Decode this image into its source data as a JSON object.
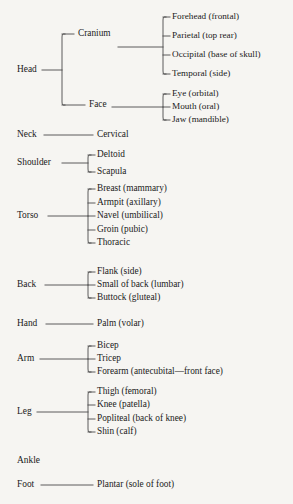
{
  "diagram": {
    "title": "Anatomical Regions Tree",
    "type": "hierarchy-tree",
    "background_color": "#f6f5f2",
    "line_color": "#4a4a4a",
    "text_color": "#1a1a1a",
    "columns": {
      "level1_x": 17,
      "level2_x": 78,
      "level3_x": 172,
      "bracket1_x": 62,
      "bracket2_x": 163,
      "bracket_mid_x": 88,
      "leaf_mid_x": 97
    },
    "nodes": [
      {
        "id": "head",
        "label": "Head",
        "x": 17,
        "y": 70,
        "level": 1,
        "bracket": {
          "x": 62,
          "top": 34,
          "bottom": 105
        },
        "connector": {
          "x1": 42,
          "x2": 62,
          "y": 70
        },
        "children": [
          {
            "id": "cranium",
            "label": "Cranium",
            "x": 78,
            "y": 34,
            "level": 2,
            "stub": {
              "x1": 62,
              "x2": 74,
              "y": 34
            },
            "bracket": {
              "x": 163,
              "top": 17,
              "bottom": 74
            },
            "connector": {
              "x1": 118,
              "x2": 163,
              "y": 47
            },
            "children": [
              {
                "id": "forehead",
                "label": "Forehead (frontal)",
                "x": 172,
                "y": 17,
                "stub": {
                  "x1": 163,
                  "x2": 170,
                  "y": 17
                }
              },
              {
                "id": "parietal",
                "label": "Parietal (top rear)",
                "x": 172,
                "y": 36,
                "stub": {
                  "x1": 163,
                  "x2": 170,
                  "y": 36
                }
              },
              {
                "id": "occipital",
                "label": "Occipital (base of skull)",
                "x": 172,
                "y": 55,
                "stub": {
                  "x1": 163,
                  "x2": 170,
                  "y": 55
                }
              },
              {
                "id": "temporal",
                "label": "Temporal (side)",
                "x": 172,
                "y": 74,
                "stub": {
                  "x1": 163,
                  "x2": 170,
                  "y": 74
                }
              }
            ]
          },
          {
            "id": "face",
            "label": "Face",
            "x": 89,
            "y": 105,
            "level": 2,
            "stub": {
              "x1": 62,
              "x2": 85,
              "y": 105
            },
            "bracket": {
              "x": 163,
              "top": 94,
              "bottom": 120
            },
            "connector": {
              "x1": 112,
              "x2": 163,
              "y": 107
            },
            "children": [
              {
                "id": "eye",
                "label": "Eye (orbital)",
                "x": 172,
                "y": 94,
                "stub": {
                  "x1": 163,
                  "x2": 170,
                  "y": 94
                }
              },
              {
                "id": "mouth",
                "label": "Mouth (oral)",
                "x": 172,
                "y": 107,
                "stub": {
                  "x1": 163,
                  "x2": 170,
                  "y": 107
                }
              },
              {
                "id": "jaw",
                "label": "Jaw (mandible)",
                "x": 172,
                "y": 120,
                "stub": {
                  "x1": 163,
                  "x2": 170,
                  "y": 120
                }
              }
            ]
          }
        ]
      },
      {
        "id": "neck",
        "label": "Neck",
        "x": 17,
        "y": 135,
        "level": 1,
        "connector": {
          "x1": 44,
          "x2": 93,
          "y": 135
        },
        "children": [
          {
            "id": "cervical",
            "label": "Cervical",
            "x": 97,
            "y": 135
          }
        ]
      },
      {
        "id": "shoulder",
        "label": "Shoulder",
        "x": 17,
        "y": 163,
        "level": 1,
        "connector": {
          "x1": 62,
          "x2": 88,
          "y": 163
        },
        "bracket": {
          "x": 88,
          "top": 155,
          "bottom": 172
        },
        "children": [
          {
            "id": "deltoid",
            "label": "Deltoid",
            "x": 97,
            "y": 155,
            "stub": {
              "x1": 88,
              "x2": 95,
              "y": 155
            }
          },
          {
            "id": "scapula",
            "label": "Scapula",
            "x": 97,
            "y": 172,
            "stub": {
              "x1": 88,
              "x2": 95,
              "y": 172
            }
          }
        ]
      },
      {
        "id": "torso",
        "label": "Torso",
        "x": 17,
        "y": 216,
        "level": 1,
        "connector": {
          "x1": 48,
          "x2": 88,
          "y": 216
        },
        "bracket": {
          "x": 88,
          "top": 189,
          "bottom": 243
        },
        "children": [
          {
            "id": "breast",
            "label": "Breast (mammary)",
            "x": 97,
            "y": 189,
            "stub": {
              "x1": 88,
              "x2": 95,
              "y": 189
            }
          },
          {
            "id": "armpit",
            "label": "Armpit (axillary)",
            "x": 97,
            "y": 203,
            "stub": {
              "x1": 88,
              "x2": 95,
              "y": 203
            }
          },
          {
            "id": "navel",
            "label": "Navel (umbilical)",
            "x": 97,
            "y": 216,
            "stub": {
              "x1": 88,
              "x2": 95,
              "y": 216
            }
          },
          {
            "id": "groin",
            "label": "Groin (pubic)",
            "x": 97,
            "y": 230,
            "stub": {
              "x1": 88,
              "x2": 95,
              "y": 230
            }
          },
          {
            "id": "thoracic",
            "label": "Thoracic",
            "x": 97,
            "y": 243,
            "stub": {
              "x1": 88,
              "x2": 95,
              "y": 243
            }
          }
        ]
      },
      {
        "id": "back",
        "label": "Back",
        "x": 17,
        "y": 285,
        "level": 1,
        "connector": {
          "x1": 45,
          "x2": 88,
          "y": 285
        },
        "bracket": {
          "x": 88,
          "top": 272,
          "bottom": 298
        },
        "children": [
          {
            "id": "flank",
            "label": "Flank (side)",
            "x": 97,
            "y": 272,
            "stub": {
              "x1": 88,
              "x2": 95,
              "y": 272
            }
          },
          {
            "id": "lumbar",
            "label": "Small of back (lumbar)",
            "x": 97,
            "y": 285,
            "stub": {
              "x1": 88,
              "x2": 95,
              "y": 285
            }
          },
          {
            "id": "buttock",
            "label": "Buttock (gluteal)",
            "x": 97,
            "y": 298,
            "stub": {
              "x1": 88,
              "x2": 95,
              "y": 298
            }
          }
        ]
      },
      {
        "id": "hand",
        "label": "Hand",
        "x": 17,
        "y": 324,
        "level": 1,
        "connector": {
          "x1": 46,
          "x2": 93,
          "y": 324
        },
        "children": [
          {
            "id": "palm",
            "label": "Palm (volar)",
            "x": 97,
            "y": 324
          }
        ]
      },
      {
        "id": "arm",
        "label": "Arm",
        "x": 17,
        "y": 359,
        "level": 1,
        "connector": {
          "x1": 40,
          "x2": 88,
          "y": 359
        },
        "bracket": {
          "x": 88,
          "top": 346,
          "bottom": 372
        },
        "children": [
          {
            "id": "bicep",
            "label": "Bicep",
            "x": 97,
            "y": 346,
            "stub": {
              "x1": 88,
              "x2": 95,
              "y": 346
            }
          },
          {
            "id": "tricep",
            "label": "Tricep",
            "x": 97,
            "y": 359,
            "stub": {
              "x1": 88,
              "x2": 95,
              "y": 359
            }
          },
          {
            "id": "forearm",
            "label": "Forearm (antecubital—front face)",
            "x": 97,
            "y": 372,
            "stub": {
              "x1": 88,
              "x2": 95,
              "y": 372
            }
          }
        ]
      },
      {
        "id": "leg",
        "label": "Leg",
        "x": 17,
        "y": 412,
        "level": 1,
        "connector": {
          "x1": 37,
          "x2": 88,
          "y": 412
        },
        "bracket": {
          "x": 88,
          "top": 392,
          "bottom": 432
        },
        "children": [
          {
            "id": "thigh",
            "label": "Thigh (femoral)",
            "x": 97,
            "y": 392,
            "stub": {
              "x1": 88,
              "x2": 95,
              "y": 392
            }
          },
          {
            "id": "knee",
            "label": "Knee (patella)",
            "x": 97,
            "y": 405,
            "stub": {
              "x1": 88,
              "x2": 95,
              "y": 405
            }
          },
          {
            "id": "popliteal",
            "label": "Popliteal (back of knee)",
            "x": 97,
            "y": 419,
            "stub": {
              "x1": 88,
              "x2": 95,
              "y": 419
            }
          },
          {
            "id": "shin",
            "label": "Shin (calf)",
            "x": 97,
            "y": 432,
            "stub": {
              "x1": 88,
              "x2": 95,
              "y": 432
            }
          }
        ]
      },
      {
        "id": "ankle",
        "label": "Ankle",
        "x": 17,
        "y": 461,
        "level": 1,
        "children": []
      },
      {
        "id": "foot",
        "label": "Foot",
        "x": 17,
        "y": 485,
        "level": 1,
        "connector": {
          "x1": 41,
          "x2": 93,
          "y": 485
        },
        "children": [
          {
            "id": "plantar",
            "label": "Plantar (sole of foot)",
            "x": 97,
            "y": 485
          }
        ]
      }
    ]
  }
}
